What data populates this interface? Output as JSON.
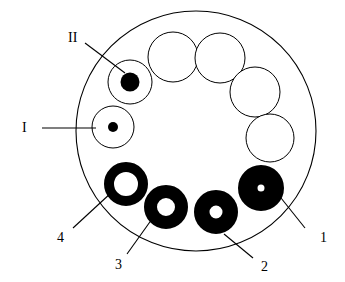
{
  "figure": {
    "background_color": "#ffffff",
    "stroke_color": "#000000",
    "fill_color": "#000000",
    "outer_boundary": {
      "name": "outer-circle",
      "cx": 196,
      "cy": 131,
      "r": 120,
      "stroke_width": 1.1,
      "fill": "none"
    },
    "elements": [
      {
        "id": "empty-1",
        "kind": "outline-circle",
        "cx": 173,
        "cy": 57,
        "r": 25,
        "hole_r": 0,
        "dot_r": 0,
        "stroke_width": 1.0,
        "filled": false
      },
      {
        "id": "empty-2",
        "kind": "outline-circle",
        "cx": 220,
        "cy": 58,
        "r": 25,
        "hole_r": 0,
        "dot_r": 0,
        "stroke_width": 1.0,
        "filled": false
      },
      {
        "id": "empty-3",
        "kind": "outline-circle",
        "cx": 255,
        "cy": 92,
        "r": 25,
        "hole_r": 0,
        "dot_r": 0,
        "stroke_width": 1.0,
        "filled": false
      },
      {
        "id": "empty-4",
        "kind": "outline-circle",
        "cx": 270,
        "cy": 138,
        "r": 24,
        "hole_r": 0,
        "dot_r": 0,
        "stroke_width": 1.0,
        "filled": false
      },
      {
        "id": "element-1",
        "kind": "filled-disk-with-dot",
        "cx": 261,
        "cy": 188,
        "r": 23,
        "hole_r": 3.5,
        "dot_r": 0,
        "stroke_width": 0,
        "filled": true,
        "label": "1"
      },
      {
        "id": "element-2",
        "kind": "filled-disk-with-dot",
        "cx": 216,
        "cy": 212,
        "r": 22,
        "hole_r": 6.5,
        "dot_r": 0,
        "stroke_width": 0,
        "filled": true,
        "label": "2"
      },
      {
        "id": "element-3",
        "kind": "filled-ring",
        "cx": 166,
        "cy": 207,
        "r": 22,
        "hole_r": 9,
        "dot_r": 0,
        "stroke_width": 0,
        "filled": true,
        "label": "3"
      },
      {
        "id": "element-4",
        "kind": "filled-ring",
        "cx": 126,
        "cy": 184,
        "r": 22,
        "hole_r": 12,
        "dot_r": 0,
        "stroke_width": 0,
        "filled": true,
        "label": "4"
      },
      {
        "id": "element-I",
        "kind": "outline-circle-with-dot",
        "cx": 113,
        "cy": 127,
        "r": 21,
        "hole_r": 0,
        "dot_r": 5,
        "stroke_width": 1.0,
        "filled": false,
        "label": "I"
      },
      {
        "id": "element-II",
        "kind": "outline-circle-with-dot",
        "cx": 130,
        "cy": 82,
        "r": 22,
        "hole_r": 0,
        "dot_r": 9.5,
        "stroke_width": 1.0,
        "filled": false,
        "label": "II"
      }
    ],
    "leader_lines": [
      {
        "id": "leader-II",
        "for": "II",
        "x1": 85,
        "y1": 43,
        "x2": 125,
        "y2": 73,
        "stroke_width": 1.1
      },
      {
        "id": "leader-I",
        "for": "I",
        "x1": 42,
        "y1": 128,
        "x2": 96,
        "y2": 128,
        "stroke_width": 1.1
      },
      {
        "id": "leader-4",
        "for": "4",
        "x1": 73,
        "y1": 228,
        "x2": 112,
        "y2": 192,
        "stroke_width": 1.1
      },
      {
        "id": "leader-3",
        "for": "3",
        "x1": 127,
        "y1": 254,
        "x2": 152,
        "y2": 219,
        "stroke_width": 1.1
      },
      {
        "id": "leader-2",
        "for": "2",
        "x1": 253,
        "y1": 258,
        "x2": 224,
        "y2": 234,
        "stroke_width": 1.1
      },
      {
        "id": "leader-1",
        "for": "1",
        "x1": 305,
        "y1": 228,
        "x2": 281,
        "y2": 198,
        "stroke_width": 1.1
      }
    ],
    "callout_labels": [
      {
        "id": "label-II",
        "text": "II",
        "x": 68,
        "y": 31
      },
      {
        "id": "label-I",
        "text": "I",
        "x": 22,
        "y": 121
      },
      {
        "id": "label-4",
        "text": "4",
        "x": 57,
        "y": 231
      },
      {
        "id": "label-3",
        "text": "3",
        "x": 115,
        "y": 258
      },
      {
        "id": "label-2",
        "text": "2",
        "x": 261,
        "y": 260
      },
      {
        "id": "label-1",
        "text": "1",
        "x": 320,
        "y": 231
      }
    ]
  }
}
